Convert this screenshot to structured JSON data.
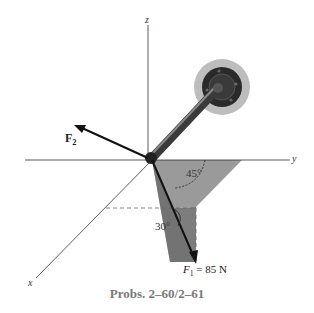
{
  "diagram": {
    "axes": {
      "x_label": "x",
      "y_label": "y",
      "z_label": "z"
    },
    "forces": {
      "f1": {
        "symbol": "F",
        "subscript": "1",
        "value_text": "= 85 N"
      },
      "f2": {
        "symbol": "F",
        "subscript": "2"
      }
    },
    "angles": {
      "angle_a": "45°",
      "angle_b": "30°"
    },
    "caption": "Probs. 2–60/2–61"
  },
  "colors": {
    "axis_line": "#333333",
    "shaded_plane_dark": "#7d7d7d",
    "shaded_plane_light": "#9a9a9a",
    "rod": "#4a4a4a",
    "wall_disk": "#bdbdbd",
    "flange": "#2a2a2a",
    "caption": "#7a7a7a"
  }
}
